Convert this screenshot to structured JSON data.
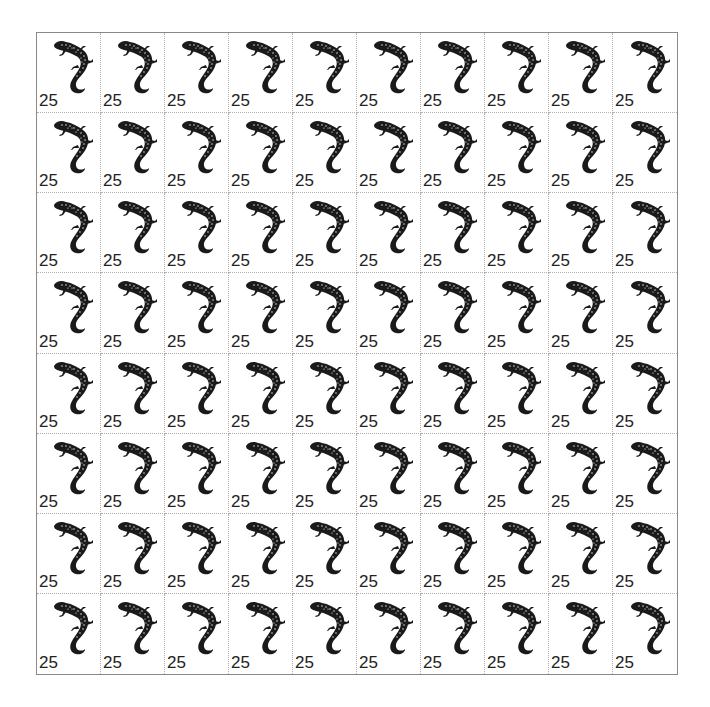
{
  "sheet": {
    "rows": 8,
    "cols": 10,
    "denomination": "25",
    "icon": "lizard-icon",
    "colors": {
      "ink": "#1a1a1a",
      "perforation": "#b0b0b0",
      "border": "#8a8a8a",
      "paper": "#ffffff"
    }
  }
}
